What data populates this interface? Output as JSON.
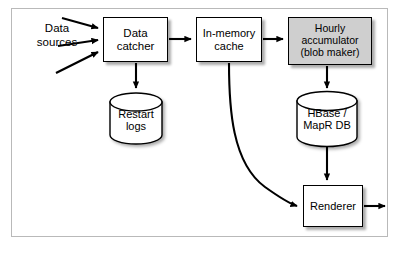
{
  "diagram": {
    "background_color": "#ffffff",
    "frame_color": "#b9b9b9",
    "stroke_color": "#000000",
    "shaded_fill": "#cfcfcf",
    "node_fill": "#ffffff",
    "nodes": [
      {
        "id": "data-sources",
        "label": "Data\nsources",
        "line1": "Data",
        "line2": "sources",
        "shape": "text",
        "x": 26,
        "y": 22,
        "w": 66,
        "h": 34,
        "font_size": 11.5
      },
      {
        "id": "data-catcher",
        "label": "Data\ncatcher",
        "line1": "Data",
        "line2": "catcher",
        "shape": "box",
        "fill": "#ffffff",
        "x": 103,
        "y": 17,
        "w": 65,
        "h": 45,
        "font_size": 11.5
      },
      {
        "id": "restart-logs",
        "label": "Restart\nlogs",
        "line1": "Restart",
        "line2": "logs",
        "shape": "cylinder",
        "fill": "#ffffff",
        "x": 110,
        "y": 93,
        "w": 52,
        "h": 51,
        "font_size": 11
      },
      {
        "id": "in-memory-cache",
        "label": "In-memory\ncache",
        "line1": "In-memory",
        "line2": "cache",
        "shape": "box",
        "fill": "#ffffff",
        "x": 196,
        "y": 17,
        "w": 66,
        "h": 45,
        "font_size": 11
      },
      {
        "id": "hourly-accumulator",
        "label": "Hourly\naccumulator\n(blob maker)",
        "line1": "Hourly",
        "line2": "accumulator",
        "line3": "(blob maker)",
        "shape": "box",
        "fill": "#cfcfcf",
        "x": 288,
        "y": 17,
        "w": 84,
        "h": 48,
        "font_size": 10.5
      },
      {
        "id": "hbase-mapr-db",
        "label": "HBase /\nMapR DB",
        "line1": "HBase /",
        "line2": "MapR DB",
        "shape": "cylinder",
        "fill": "#ffffff",
        "x": 297,
        "y": 92,
        "w": 60,
        "h": 54,
        "font_size": 11
      },
      {
        "id": "renderer",
        "label": "Renderer",
        "line1": "Renderer",
        "shape": "box",
        "fill": "#ffffff",
        "x": 303,
        "y": 185,
        "w": 60,
        "h": 42,
        "font_size": 11
      }
    ],
    "edges": [
      {
        "id": "source-1-to-catcher",
        "from": "data-sources",
        "to": "data-catcher",
        "style": "straight"
      },
      {
        "id": "source-2-to-catcher",
        "from": "data-sources",
        "to": "data-catcher",
        "style": "straight"
      },
      {
        "id": "source-3-to-catcher",
        "from": "data-sources",
        "to": "data-catcher",
        "style": "straight"
      },
      {
        "id": "catcher-to-cache",
        "from": "data-catcher",
        "to": "in-memory-cache",
        "style": "straight"
      },
      {
        "id": "catcher-to-restart-logs",
        "from": "data-catcher",
        "to": "restart-logs",
        "style": "straight"
      },
      {
        "id": "cache-to-accumulator",
        "from": "in-memory-cache",
        "to": "hourly-accumulator",
        "style": "straight"
      },
      {
        "id": "cache-to-renderer",
        "from": "in-memory-cache",
        "to": "renderer",
        "style": "curved"
      },
      {
        "id": "accumulator-to-hbase",
        "from": "hourly-accumulator",
        "to": "hbase-mapr-db",
        "style": "straight"
      },
      {
        "id": "hbase-to-renderer",
        "from": "hbase-mapr-db",
        "to": "renderer",
        "style": "straight"
      },
      {
        "id": "renderer-output",
        "from": "renderer",
        "to": "output",
        "style": "straight"
      }
    ]
  }
}
